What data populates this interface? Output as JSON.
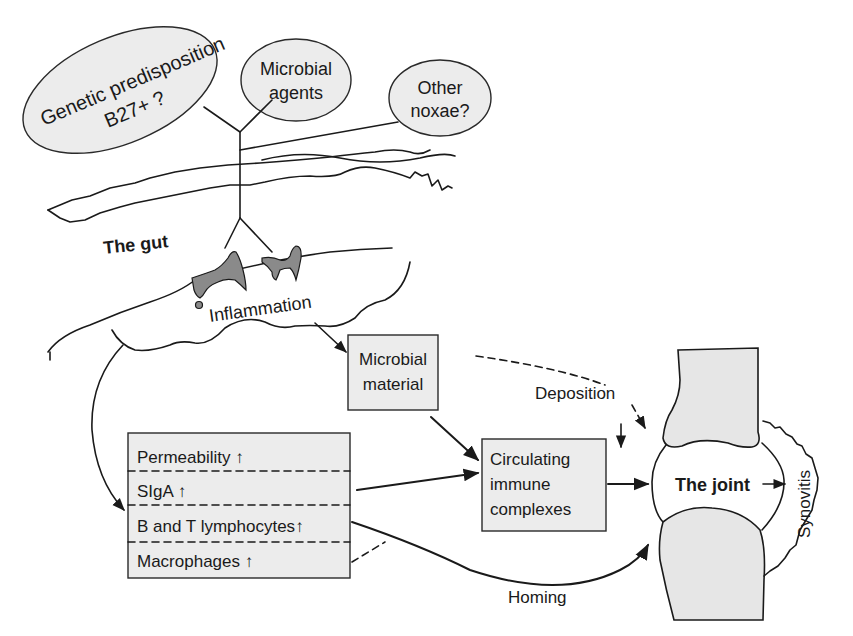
{
  "diagram": {
    "ovals": {
      "genetic": {
        "line1": "Genetic predisposition",
        "line2": "B27+ ?"
      },
      "microbial_agents": {
        "line1": "Microbial",
        "line2": "agents"
      },
      "other_noxae": {
        "line1": "Other",
        "line2": "noxae?"
      }
    },
    "gut_label": "The gut",
    "inflammation_label": "Inflammation",
    "microbial_material": {
      "line1": "Microbial",
      "line2": "material"
    },
    "deposition_label": "Deposition",
    "gut_changes": [
      {
        "label": "Permeability",
        "arrow": "↑"
      },
      {
        "label": "SIgA",
        "arrow": "↑"
      },
      {
        "label": "B and T lymphocytes",
        "arrow": "↑"
      },
      {
        "label": "Macrophages",
        "arrow": "↑"
      }
    ],
    "immune_complexes": {
      "line1": "Circulating",
      "line2": "immune",
      "line3": "complexes"
    },
    "joint_label": "The joint",
    "synovitis_label": "Synovitis",
    "homing_label": "Homing",
    "colors": {
      "box_fill": "#ececec",
      "bone_fill": "#e6e6e6",
      "lesion_fill": "#8a8a8a",
      "line": "#1a1a1a"
    }
  }
}
